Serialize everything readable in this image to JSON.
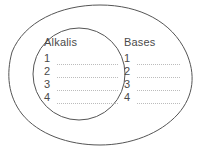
{
  "diagram": {
    "type": "venn-containment",
    "stroke_color": "#555555",
    "text_color": "#4a4a4a",
    "rule_color": "#bcbcbc",
    "background_color": "#ffffff",
    "outer_set": {
      "name": "Bases",
      "shape": "egg-oval",
      "label": "Bases",
      "entries": [
        {
          "number": "1",
          "text": ""
        },
        {
          "number": "2",
          "text": ""
        },
        {
          "number": "3",
          "text": ""
        },
        {
          "number": "4",
          "text": ""
        }
      ]
    },
    "inner_set": {
      "name": "Alkalis",
      "shape": "circle",
      "label": "Alkalis",
      "entries": [
        {
          "number": "1",
          "text": ""
        },
        {
          "number": "2",
          "text": ""
        },
        {
          "number": "3",
          "text": ""
        },
        {
          "number": "4",
          "text": ""
        }
      ]
    }
  }
}
